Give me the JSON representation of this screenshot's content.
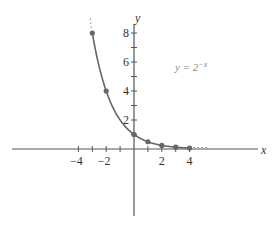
{
  "chart_data": {
    "type": "line",
    "title": "",
    "xlabel": "x",
    "ylabel": "y",
    "annotation": "y = 2^(-x)",
    "annotation_display": {
      "base": "y = 2",
      "exponent": "−x"
    },
    "xlim": [
      -9,
      9
    ],
    "ylim": [
      -5,
      9
    ],
    "x_ticks": [
      -4,
      -3,
      -2,
      -1,
      0,
      1,
      2,
      3,
      4
    ],
    "x_tick_labels": [
      {
        "value": -4,
        "label": "−4"
      },
      {
        "value": -2,
        "label": "−2"
      },
      {
        "value": 2,
        "label": "2"
      },
      {
        "value": 4,
        "label": "4"
      }
    ],
    "y_ticks": [
      1,
      2,
      3,
      4,
      5,
      6,
      7,
      8
    ],
    "y_tick_labels": [
      {
        "value": 2,
        "label": "2"
      },
      {
        "value": 4,
        "label": "4"
      },
      {
        "value": 6,
        "label": "6"
      },
      {
        "value": 8,
        "label": "8"
      }
    ],
    "grid": false,
    "legend": null,
    "series": [
      {
        "name": "y = 2^-x",
        "x": [
          -3,
          -2,
          0,
          1,
          2,
          3,
          4
        ],
        "y": [
          8,
          4,
          1,
          0.5,
          0.25,
          0.125,
          0.0625
        ],
        "markers": true,
        "continues_beyond": "dotted at both ends"
      }
    ]
  }
}
